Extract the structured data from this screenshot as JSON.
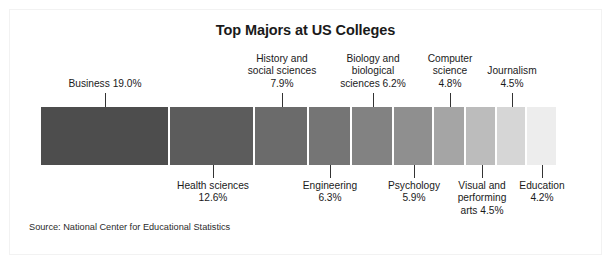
{
  "chart_data": {
    "type": "bar",
    "subtype": "stacked-horizontal-single-bar",
    "title": "Top Majors at US Colleges",
    "subtitle": "",
    "xlabel": "",
    "ylabel": "",
    "grid": false,
    "legend": "none",
    "units": "percent",
    "source": "Source: National Center for Educational Statistics",
    "categories": [
      "Business",
      "Health sciences",
      "History and social sciences",
      "Engineering",
      "Biology and biological sciences",
      "Psychology",
      "Computer science",
      "Visual and performing arts",
      "Journalism",
      "Education"
    ],
    "values": [
      19.0,
      12.6,
      7.9,
      6.3,
      6.2,
      5.9,
      4.8,
      4.5,
      4.5,
      4.2
    ],
    "value_labels": [
      "19.0%",
      "12.6%",
      "7.9%",
      "6.3%",
      "6.2%",
      "5.9%",
      "4.8%",
      "4.5%",
      "4.5%",
      "4.2%"
    ],
    "colors": [
      "#4d4d4d",
      "#5c5c5c",
      "#6b6b6b",
      "#757575",
      "#828282",
      "#8f8f8f",
      "#a5a5a5",
      "#bcbcbc",
      "#d6d6d6",
      "#ededed"
    ],
    "label_sides": [
      "top",
      "bottom",
      "top",
      "bottom",
      "top",
      "bottom",
      "top",
      "bottom",
      "top",
      "bottom"
    ],
    "segments": [
      {
        "name": "Business",
        "value": 19.0,
        "label": "Business 19.0%",
        "value_label": "19.0%",
        "color": "#4d4d4d",
        "side": "top"
      },
      {
        "name": "Health sciences",
        "value": 12.6,
        "label": "Health sciences\n12.6%",
        "value_label": "12.6%",
        "color": "#5c5c5c",
        "side": "bottom"
      },
      {
        "name": "History and social sciences",
        "value": 7.9,
        "label": "History and\nsocial sciences\n7.9%",
        "value_label": "7.9%",
        "color": "#6b6b6b",
        "side": "top"
      },
      {
        "name": "Engineering",
        "value": 6.3,
        "label": "Engineering\n6.3%",
        "value_label": "6.3%",
        "color": "#757575",
        "side": "bottom"
      },
      {
        "name": "Biology and biological sciences",
        "value": 6.2,
        "label": "Biology and\nbiological\nsciences 6.2%",
        "value_label": "6.2%",
        "color": "#828282",
        "side": "top"
      },
      {
        "name": "Psychology",
        "value": 5.9,
        "label": "Psychology\n5.9%",
        "value_label": "5.9%",
        "color": "#8f8f8f",
        "side": "bottom"
      },
      {
        "name": "Computer science",
        "value": 4.8,
        "label": "Computer\nscience\n4.8%",
        "value_label": "4.8%",
        "color": "#a5a5a5",
        "side": "top"
      },
      {
        "name": "Visual and performing arts",
        "value": 4.5,
        "label": "Visual and\nperforming\narts 4.5%",
        "value_label": "4.5%",
        "color": "#bcbcbc",
        "side": "bottom"
      },
      {
        "name": "Journalism",
        "value": 4.5,
        "label": "Journalism\n4.5%",
        "value_label": "4.5%",
        "color": "#d6d6d6",
        "side": "top"
      },
      {
        "name": "Education",
        "value": 4.2,
        "label": "Education\n4.2%",
        "value_label": "4.2%",
        "color": "#ededed",
        "side": "bottom"
      }
    ]
  },
  "figure": {
    "title": "Top Majors at US Colleges",
    "source": "Source: National Center for Educational Statistics"
  }
}
